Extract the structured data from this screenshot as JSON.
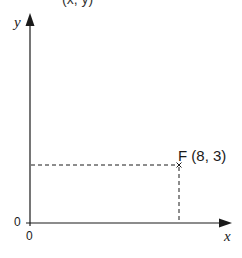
{
  "diagram": {
    "top_fragment": "(x, y)",
    "axes": {
      "x_label": "x",
      "y_label": "y",
      "x_origin_label": "0",
      "y_origin_label": "0"
    },
    "point": {
      "name": "F",
      "label": "F (8, 3)",
      "x": 8,
      "y": 3,
      "marker": "x-mark"
    },
    "colors": {
      "line": "#1a1a1a",
      "background": "#ffffff"
    }
  }
}
